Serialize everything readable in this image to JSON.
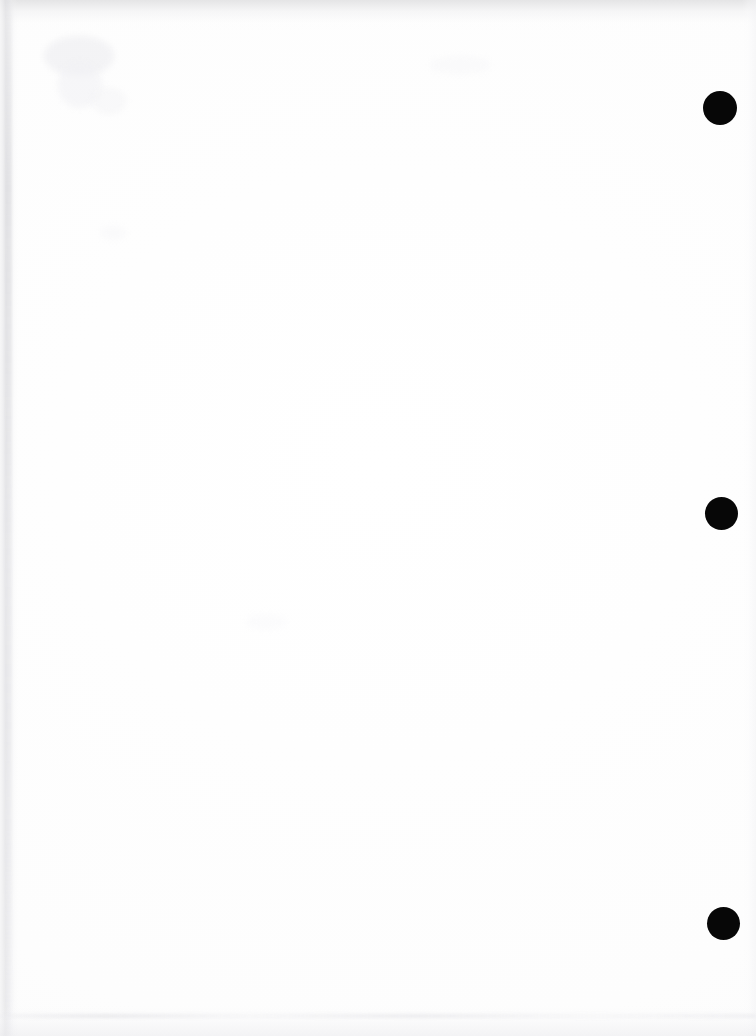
{
  "document": {
    "kind": "scanned-page",
    "title": "Scanned Blank Page",
    "page_width": 756,
    "page_height": 1036,
    "page_color": "#fefefe",
    "body_text": "",
    "body_note": "blank page — no printed content"
  },
  "marks": {
    "label": "registration-marks",
    "color": "#070707",
    "items": [
      {
        "name": "punch-mark-top",
        "cx": 720,
        "cy": 108,
        "d": 34,
        "label": ""
      },
      {
        "name": "punch-mark-middle",
        "cx": 721,
        "cy": 513,
        "d": 33,
        "label": ""
      },
      {
        "name": "punch-mark-bottom",
        "cx": 723,
        "cy": 923,
        "d": 33,
        "label": ""
      }
    ]
  },
  "artifacts": {
    "top_edge": "",
    "left_edge": "",
    "right_edge": "",
    "bottom_edge": "",
    "smudges": [
      "",
      "",
      "",
      "",
      "",
      ""
    ]
  }
}
